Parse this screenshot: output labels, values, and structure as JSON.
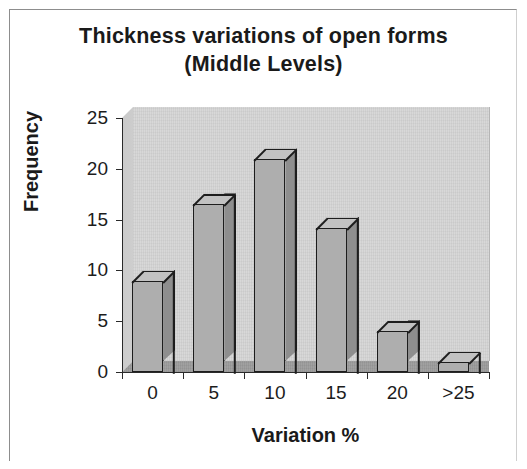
{
  "chart_data": {
    "type": "bar",
    "title": "Thickness variations of open forms (Middle Levels)",
    "title_line1": "Thickness variations of open forms",
    "title_line2": "(Middle Levels)",
    "xlabel": "Variation %",
    "ylabel": "Frequency",
    "categories": [
      "0",
      "5",
      "10",
      "15",
      "20",
      ">25"
    ],
    "values": [
      9,
      16.5,
      21,
      14.2,
      4,
      1
    ],
    "ylim": [
      0,
      25
    ],
    "ytick_labels": [
      "0",
      "5",
      "10",
      "15",
      "20",
      "25"
    ],
    "ytick_values": [
      0,
      5,
      10,
      15,
      20,
      25
    ],
    "grid": false,
    "legend": false,
    "style": "3d-column",
    "colors": {
      "bar_front": "#aeaeae",
      "bar_side": "#8e8e8e",
      "bar_top": "#c2c2c2",
      "bar_outline": "#1d1d1d",
      "back_wall": "#d6d6d6",
      "floor": "#9c9c9c",
      "axis": "#2a2a2a",
      "text": "#1a1a1a",
      "background": "#ffffff"
    }
  }
}
